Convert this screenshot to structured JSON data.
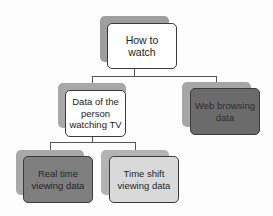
{
  "diagram": {
    "type": "hierarchy",
    "root": {
      "label": "How to watch",
      "fill": "#ffffff",
      "shadow": "#9e9e9e"
    },
    "level1": [
      {
        "label": "Data of the person watching TV",
        "fill": "#ffffff",
        "shadow": "#a8a8a8"
      },
      {
        "label": "Web browsing data",
        "fill": "#6b6b6b",
        "shadow": "#a6a6a6"
      }
    ],
    "level2": [
      {
        "label": "Real time viewing data",
        "fill": "#7f7f7f",
        "shadow": "#a8a8a8"
      },
      {
        "label": "Time shift viewing data",
        "fill": "#d9d9d9",
        "shadow": "#b3b3b3"
      }
    ],
    "edges": [
      {
        "from": "How to watch",
        "to": "Data of the person watching TV"
      },
      {
        "from": "How to watch",
        "to": "Web browsing data"
      },
      {
        "from": "Data of the person watching TV",
        "to": "Real time viewing data"
      },
      {
        "from": "Data of the person watching TV",
        "to": "Time shift viewing data"
      }
    ],
    "colors": {
      "connector": "#555555",
      "border": "#3a3a3a",
      "text": "#222222"
    }
  }
}
